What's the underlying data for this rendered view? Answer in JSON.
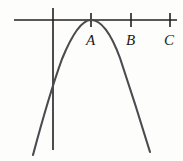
{
  "figure": {
    "background_color": "#fdfdfc",
    "axis_color": "#231f20",
    "curve_color": "#4a4a4f",
    "label_color": "#1a1a1a",
    "width": 183,
    "height": 161
  },
  "axes": {
    "horizontal": {
      "name": "x-axis",
      "x1": 14,
      "y1": 20,
      "x2": 177,
      "y2": 20
    },
    "vertical": {
      "name": "y-axis",
      "x1": 53,
      "y1": 8,
      "x2": 53,
      "y2": 150
    }
  },
  "ticks": [
    {
      "id": "A",
      "x": 91,
      "y": 20,
      "top": 13,
      "bottom": 27
    },
    {
      "id": "B",
      "x": 131,
      "y": 20,
      "top": 13,
      "bottom": 27
    },
    {
      "id": "C",
      "x": 170,
      "y": 20,
      "top": 13,
      "bottom": 27
    }
  ],
  "labels": [
    {
      "id": "A",
      "text": "A",
      "x": 86,
      "y": 33
    },
    {
      "id": "B",
      "text": "B",
      "x": 126,
      "y": 33
    },
    {
      "id": "C",
      "text": "C",
      "x": 164,
      "y": 33
    }
  ],
  "chart_data": {
    "type": "line",
    "title": "",
    "xlabel": "",
    "ylabel": "",
    "grid": false,
    "legend": null,
    "curve": {
      "name": "parabola",
      "shape": "downward-opening parabola",
      "vertex_px": [
        91,
        20
      ],
      "tangent_to_x_axis": true,
      "y_axis_intersection_px": [
        53,
        73
      ],
      "left_endpoint_px": [
        33,
        155
      ],
      "right_endpoint_px": [
        150,
        152
      ],
      "path": "M 33 155 Q 49 95 62 59 Q 78 20 91 20 Q 106 20 120 58 Q 136 106 150 152"
    },
    "x_axis_points": [
      {
        "label": "A",
        "px": 91
      },
      {
        "label": "B",
        "px": 131
      },
      {
        "label": "C",
        "px": 170
      }
    ],
    "annotations": [
      "Vertex of the parabola coincides with point A on the horizontal axis",
      "Points B and C lie to the right of A on the horizontal axis"
    ]
  }
}
